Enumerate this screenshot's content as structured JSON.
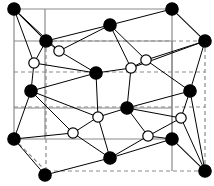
{
  "figure": {
    "width": 214,
    "height": 186,
    "background_color": "#ffffff"
  },
  "style": {
    "filled_atom_fill": "#000000",
    "filled_atom_stroke": "#000000",
    "open_atom_fill": "#ffffff",
    "open_atom_stroke": "#000000",
    "bond_color": "#000000",
    "cell_edge_solid_color": "#8a8a8a",
    "cell_edge_hidden_color": "#8a8a8a",
    "filled_atom_radius": 6.2,
    "open_atom_radius": 5.2,
    "atom_stroke_width": 1.2,
    "bond_stroke_width": 1.0,
    "cell_edge_stroke_width": 1.2,
    "hidden_edge_dash": "4,3"
  },
  "cell_box": {
    "front_face": [
      {
        "name": "front-top-left",
        "x": 14,
        "y": 9
      },
      {
        "name": "front-top-right",
        "x": 172,
        "y": 9
      },
      {
        "name": "front-bottom-right",
        "x": 172,
        "y": 139
      },
      {
        "name": "front-bottom-left",
        "x": 14,
        "y": 139
      }
    ],
    "back_face": [
      {
        "name": "back-top-left",
        "x": 46,
        "y": 41
      },
      {
        "name": "back-top-right",
        "x": 205,
        "y": 41
      },
      {
        "name": "back-bottom-right",
        "x": 205,
        "y": 171
      },
      {
        "name": "back-bottom-left",
        "x": 46,
        "y": 171
      }
    ],
    "interior_guides": [
      {
        "name": "mid-hidden-upper",
        "x1": 14,
        "y1": 72,
        "x2": 205,
        "y2": 72
      },
      {
        "name": "mid-hidden-lower",
        "x1": 14,
        "y1": 107,
        "x2": 205,
        "y2": 107
      },
      {
        "name": "mid-solid-front-upper",
        "x1": 14,
        "y1": 41,
        "x2": 172,
        "y2": 41
      },
      {
        "name": "mid-solid-front-lower",
        "x1": 14,
        "y1": 108,
        "x2": 172,
        "y2": 108
      },
      {
        "name": "mid-vertical-front",
        "x1": 45,
        "y1": 9,
        "x2": 45,
        "y2": 139
      },
      {
        "name": "mid-vertical-back",
        "x1": 172,
        "y1": 41,
        "x2": 172,
        "y2": 171
      }
    ]
  },
  "atoms": {
    "filled": [
      {
        "id": "A1",
        "label": "corner-top-front-left",
        "x": 14,
        "y": 9
      },
      {
        "id": "A2",
        "label": "corner-top-front-right",
        "x": 172,
        "y": 9
      },
      {
        "id": "A3",
        "label": "corner-top-back-left",
        "x": 46,
        "y": 41
      },
      {
        "id": "A4",
        "label": "corner-top-back-right",
        "x": 205,
        "y": 41
      },
      {
        "id": "A5",
        "label": "corner-bottom-front-left",
        "x": 14,
        "y": 139
      },
      {
        "id": "A6",
        "label": "corner-bottom-front-right",
        "x": 172,
        "y": 139
      },
      {
        "id": "A7",
        "label": "corner-bottom-back-left",
        "x": 45,
        "y": 175
      },
      {
        "id": "A8",
        "label": "corner-bottom-back-right",
        "x": 205,
        "y": 171
      },
      {
        "id": "A9",
        "label": "edge-top-mid",
        "x": 110,
        "y": 25
      },
      {
        "id": "A10",
        "label": "edge-bottom-mid",
        "x": 110,
        "y": 158
      },
      {
        "id": "A11",
        "label": "face-left-upper",
        "x": 31,
        "y": 91
      },
      {
        "id": "A12",
        "label": "face-right-upper",
        "x": 190,
        "y": 91
      },
      {
        "id": "A13",
        "label": "interior-upper",
        "x": 96,
        "y": 73
      },
      {
        "id": "A14",
        "label": "interior-lower",
        "x": 127,
        "y": 108
      }
    ],
    "open": [
      {
        "id": "B1",
        "label": "open-top-left",
        "x": 59,
        "y": 51
      },
      {
        "id": "B2",
        "label": "open-left-upper",
        "x": 34,
        "y": 63
      },
      {
        "id": "B3",
        "label": "open-top-right-inner",
        "x": 131,
        "y": 68
      },
      {
        "id": "B4",
        "label": "open-top-right-outer",
        "x": 146,
        "y": 60
      },
      {
        "id": "B5",
        "label": "open-center-lower",
        "x": 98,
        "y": 117
      },
      {
        "id": "B6",
        "label": "open-right-lower",
        "x": 181,
        "y": 118
      },
      {
        "id": "B7",
        "label": "open-bottom-left",
        "x": 73,
        "y": 133
      },
      {
        "id": "B8",
        "label": "open-bottom-right",
        "x": 148,
        "y": 136
      }
    ]
  },
  "bonds": [
    {
      "from": "A1",
      "to": "A3"
    },
    {
      "from": "A1",
      "to": "B1"
    },
    {
      "from": "A1",
      "to": "B2"
    },
    {
      "from": "A3",
      "to": "B1"
    },
    {
      "from": "A3",
      "to": "B2"
    },
    {
      "from": "A3",
      "to": "A9"
    },
    {
      "from": "A9",
      "to": "B1"
    },
    {
      "from": "A9",
      "to": "B3"
    },
    {
      "from": "A9",
      "to": "B4"
    },
    {
      "from": "A9",
      "to": "A2"
    },
    {
      "from": "A2",
      "to": "A4"
    },
    {
      "from": "A4",
      "to": "B4"
    },
    {
      "from": "A4",
      "to": "B3"
    },
    {
      "from": "B4",
      "to": "B3"
    },
    {
      "from": "B2",
      "to": "A11"
    },
    {
      "from": "B2",
      "to": "A13"
    },
    {
      "from": "B1",
      "to": "A13"
    },
    {
      "from": "A11",
      "to": "A13"
    },
    {
      "from": "A13",
      "to": "B3"
    },
    {
      "from": "A13",
      "to": "B5"
    },
    {
      "from": "B3",
      "to": "A14"
    },
    {
      "from": "B4",
      "to": "A12"
    },
    {
      "from": "A12",
      "to": "A14"
    },
    {
      "from": "A12",
      "to": "B6"
    },
    {
      "from": "A12",
      "to": "A4"
    },
    {
      "from": "A14",
      "to": "B5"
    },
    {
      "from": "A14",
      "to": "B8"
    },
    {
      "from": "A14",
      "to": "B6"
    },
    {
      "from": "B5",
      "to": "B7"
    },
    {
      "from": "B5",
      "to": "A10"
    },
    {
      "from": "B7",
      "to": "A11"
    },
    {
      "from": "B7",
      "to": "A5"
    },
    {
      "from": "B7",
      "to": "A10"
    },
    {
      "from": "A11",
      "to": "A5"
    },
    {
      "from": "A5",
      "to": "A7"
    },
    {
      "from": "A7",
      "to": "A10"
    },
    {
      "from": "A10",
      "to": "B8"
    },
    {
      "from": "A10",
      "to": "A6"
    },
    {
      "from": "B8",
      "to": "A6"
    },
    {
      "from": "B8",
      "to": "B6"
    },
    {
      "from": "A6",
      "to": "A8"
    },
    {
      "from": "B6",
      "to": "A8"
    },
    {
      "from": "A12",
      "to": "A8"
    },
    {
      "from": "A11",
      "to": "B5"
    }
  ]
}
